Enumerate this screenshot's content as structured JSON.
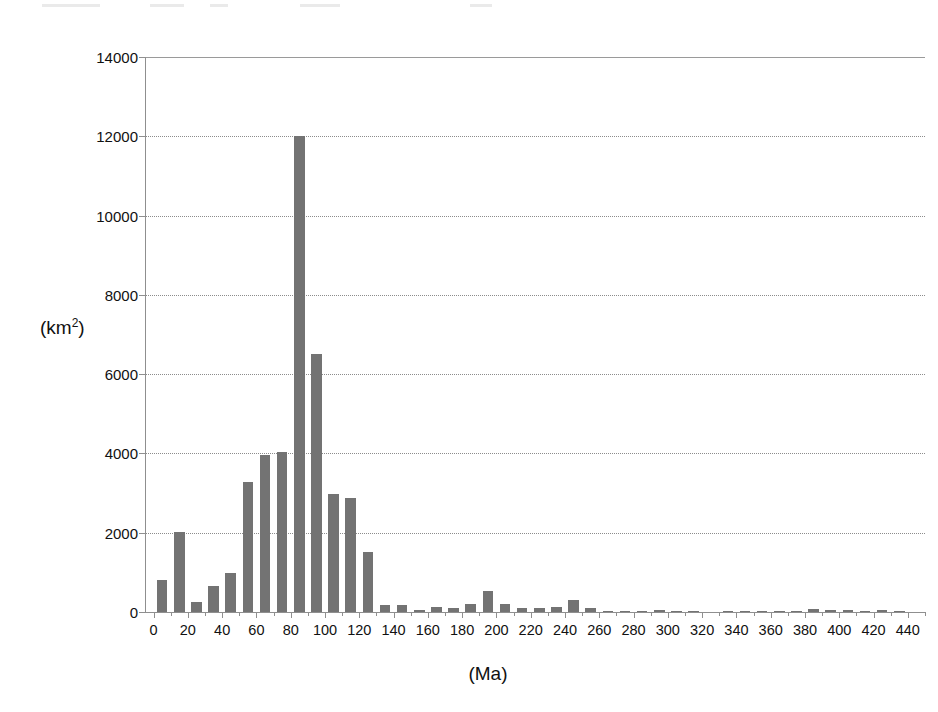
{
  "figure": {
    "background_color": "#ffffff",
    "bar_color": "#737373",
    "axis_color": "#8f8f8f",
    "grid_color": "#8c8c8c"
  },
  "axes": {
    "y_title": "(km",
    "y_title_sup": "2",
    "y_title_close": ")",
    "y_title_full": "(km2)",
    "x_title": "(Ma)"
  },
  "chart_data": {
    "type": "bar",
    "title": "",
    "subtitle": "",
    "xlabel": "(Ma)",
    "ylabel": "(km2)",
    "xlim": [
      -5,
      450
    ],
    "ylim": [
      0,
      14000
    ],
    "grid": true,
    "legend": false,
    "bin_width": 10,
    "y_ticks": [
      0,
      2000,
      4000,
      6000,
      8000,
      10000,
      12000,
      14000
    ],
    "y_tick_labels": [
      "0",
      "2000",
      "4000",
      "6000",
      "8000",
      "10000",
      "12000",
      "14000"
    ],
    "x_ticks": [
      0,
      20,
      40,
      60,
      80,
      100,
      120,
      140,
      160,
      180,
      200,
      220,
      240,
      260,
      280,
      300,
      320,
      340,
      360,
      380,
      400,
      420,
      440
    ],
    "x_tick_labels": [
      "0",
      "20",
      "40",
      "60",
      "80",
      "100",
      "120",
      "140",
      "160",
      "180",
      "200",
      "220",
      "240",
      "260",
      "280",
      "300",
      "320",
      "340",
      "360",
      "380",
      "400",
      "420",
      "440"
    ],
    "x": [
      5,
      15,
      25,
      35,
      45,
      55,
      65,
      75,
      85,
      95,
      105,
      115,
      125,
      135,
      145,
      155,
      165,
      175,
      185,
      195,
      205,
      215,
      225,
      235,
      245,
      255,
      265,
      275,
      285,
      295,
      305,
      315,
      325,
      335,
      345,
      355,
      365,
      375,
      385,
      395,
      405,
      415,
      425,
      435,
      445
    ],
    "values": [
      820,
      2030,
      260,
      650,
      990,
      3280,
      3950,
      4030,
      12000,
      6500,
      2980,
      2880,
      1520,
      180,
      170,
      60,
      120,
      110,
      190,
      520,
      200,
      100,
      110,
      120,
      300,
      110,
      20,
      10,
      10,
      60,
      10,
      10,
      0,
      10,
      10,
      10,
      10,
      30,
      80,
      60,
      60,
      20,
      60,
      10,
      0
    ],
    "categories": [
      "0-10",
      "10-20",
      "20-30",
      "30-40",
      "40-50",
      "50-60",
      "60-70",
      "70-80",
      "80-90",
      "90-100",
      "100-110",
      "110-120",
      "120-130",
      "130-140",
      "140-150",
      "150-160",
      "160-170",
      "170-180",
      "180-190",
      "190-200",
      "200-210",
      "210-220",
      "220-230",
      "230-240",
      "240-250",
      "250-260",
      "260-270",
      "270-280",
      "280-290",
      "290-300",
      "300-310",
      "310-320",
      "320-330",
      "330-340",
      "340-350",
      "350-360",
      "360-370",
      "370-380",
      "380-390",
      "390-400",
      "400-410",
      "410-420",
      "420-430",
      "430-440",
      "440-450"
    ],
    "peak": {
      "x": 85,
      "value": 12000
    },
    "annotations": []
  }
}
